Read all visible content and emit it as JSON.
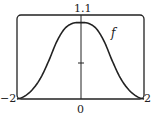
{
  "chart_data": {
    "type": "line",
    "title": "",
    "xlabel": "",
    "ylabel": "",
    "xlim": [
      -2,
      2
    ],
    "ylim": [
      0,
      1.1
    ],
    "grid": false,
    "x_tick_labels": [
      "-2",
      "0",
      "2"
    ],
    "y_tick_labels": [
      "1.1"
    ],
    "annotations": [
      "f"
    ],
    "series": [
      {
        "name": "f",
        "x": [
          -2,
          -1.75,
          -1.5,
          -1.25,
          -1,
          -0.75,
          -0.5,
          -0.25,
          0,
          0.25,
          0.5,
          0.75,
          1,
          1.25,
          1.5,
          1.75,
          2
        ],
        "values": [
          0.0,
          0.04,
          0.13,
          0.28,
          0.5,
          0.75,
          0.92,
          0.99,
          1.0,
          0.99,
          0.92,
          0.75,
          0.5,
          0.28,
          0.13,
          0.04,
          0.0
        ]
      }
    ]
  },
  "labels": {
    "ymax": "1.1",
    "xmin": "−2",
    "xzero": "0",
    "xmax": "2",
    "curve": "f"
  },
  "colors": {
    "line": "#222222",
    "frame": "#222222"
  }
}
